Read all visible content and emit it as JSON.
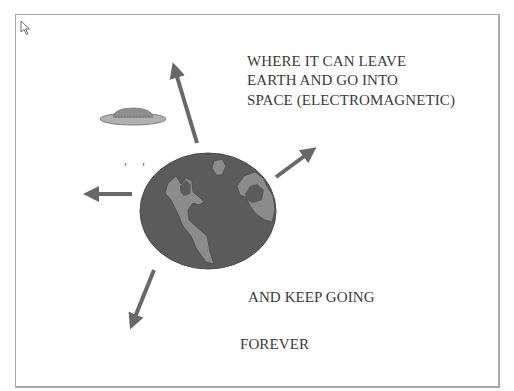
{
  "slide": {
    "caption_lines": [
      "WHERE IT CAN LEAVE",
      "EARTH AND GO INTO",
      "SPACE (ELECTROMAGNETIC)"
    ],
    "keep_going": "AND KEEP GOING",
    "forever": "FOREVER"
  },
  "colors": {
    "ocean": "#5b5b5b",
    "land": "#8c8c8c",
    "arrow": "#686868",
    "ufo_body": "#b0b0b0",
    "ufo_dome": "#8f8f8f",
    "text": "#3a3a3a",
    "frame": "#a8a8a8"
  },
  "icons": {
    "cursor": "mouse-pointer-icon",
    "earth": "earth-globe-icon",
    "ufo": "flying-saucer-icon",
    "arrows": [
      "arrow-up-icon",
      "arrow-up-right-icon",
      "arrow-left-icon",
      "arrow-down-left-icon"
    ]
  }
}
